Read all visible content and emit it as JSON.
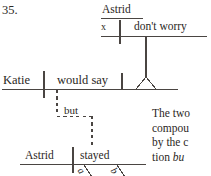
{
  "exercise": {
    "number": "35."
  },
  "diagram": {
    "type": "reed-kellogg sentence diagram",
    "embedded_clause": {
      "subject": "Astrid",
      "subject_placeholder": "x",
      "predicate": "don't worry"
    },
    "main_clause_1": {
      "subject": "Katie",
      "predicate": "would say"
    },
    "conjunction": "but",
    "main_clause_2": {
      "subject": "Astrid",
      "predicate": "stayed",
      "modifier_1": "a",
      "modifier_2": "b"
    }
  },
  "note": {
    "line1": "The two",
    "line2": "compou",
    "line3": "by the c",
    "line4_text": "tion ",
    "line4_italic": "bu"
  },
  "colors": {
    "ink": "#2b2724",
    "rule": "#4a4542",
    "paper": "#ffffff"
  }
}
